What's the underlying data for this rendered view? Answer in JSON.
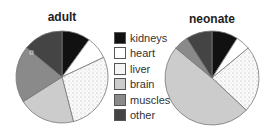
{
  "chart_data": [
    {
      "type": "pie",
      "title": "adult",
      "categories": [
        "kidneys",
        "heart",
        "liver",
        "brain",
        "muscles",
        "other"
      ],
      "values": [
        10,
        8,
        28,
        20,
        20,
        14
      ]
    },
    {
      "type": "pie",
      "title": "neonate",
      "categories": [
        "kidneys",
        "heart",
        "liver",
        "brain",
        "muscles",
        "other"
      ],
      "values": [
        9,
        5,
        23,
        49,
        5,
        9
      ]
    }
  ],
  "legend": {
    "items": [
      {
        "label": "kidneys",
        "color": "#111111"
      },
      {
        "label": "heart",
        "color": "#ffffff"
      },
      {
        "label": "liver",
        "color": "#f4f4f4"
      },
      {
        "label": "brain",
        "color": "#cccccc"
      },
      {
        "label": "muscles",
        "color": "#8a8a8a"
      },
      {
        "label": "other",
        "color": "#444444"
      }
    ]
  }
}
